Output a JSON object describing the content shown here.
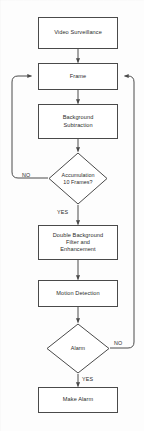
{
  "diagram": {
    "type": "flowchart",
    "stroke_color": "#4a4a4a",
    "text_color": "#2b2b2b",
    "background_color": "#fdfdfd",
    "nodes": [
      {
        "id": "video-surveillance",
        "shape": "process",
        "label": "Video Surveillance",
        "label_lines": [
          "Video Surveillance"
        ]
      },
      {
        "id": "frame",
        "shape": "process",
        "label": "Frame",
        "label_lines": [
          "Frame"
        ]
      },
      {
        "id": "background-subtraction",
        "shape": "process",
        "label": "Background Subtraction",
        "label_lines": [
          "Background",
          "Subtraction"
        ]
      },
      {
        "id": "accumulation-decision",
        "shape": "decision",
        "label": "Accumulation 10 Frames?",
        "label_lines": [
          "Accumulation",
          "10 Frames?"
        ]
      },
      {
        "id": "double-background-filter",
        "shape": "process",
        "label": "Double Background Filter and Enhancement",
        "label_lines": [
          "Double Background",
          "Filter and",
          "Enhancement"
        ]
      },
      {
        "id": "motion-detection",
        "shape": "process",
        "label": "Motion Detection",
        "label_lines": [
          "Motion Detection"
        ]
      },
      {
        "id": "alarm-decision",
        "shape": "decision",
        "label": "Alarm",
        "label_lines": [
          "Alarm"
        ]
      },
      {
        "id": "make-alarm",
        "shape": "process",
        "label": "Make Alarm",
        "label_lines": [
          "Make Alarm"
        ]
      }
    ],
    "edge_labels": {
      "accumulation_no": "NO",
      "accumulation_yes": "YES",
      "alarm_no": "NO",
      "alarm_yes": "YES"
    },
    "edges": [
      {
        "from": "video-surveillance",
        "to": "frame",
        "label": ""
      },
      {
        "from": "frame",
        "to": "background-subtraction",
        "label": ""
      },
      {
        "from": "background-subtraction",
        "to": "accumulation-decision",
        "label": ""
      },
      {
        "from": "accumulation-decision",
        "to": "frame",
        "label": "NO"
      },
      {
        "from": "accumulation-decision",
        "to": "double-background-filter",
        "label": "YES"
      },
      {
        "from": "double-background-filter",
        "to": "motion-detection",
        "label": ""
      },
      {
        "from": "motion-detection",
        "to": "alarm-decision",
        "label": ""
      },
      {
        "from": "alarm-decision",
        "to": "frame",
        "label": "NO"
      },
      {
        "from": "alarm-decision",
        "to": "make-alarm",
        "label": "YES"
      }
    ]
  }
}
